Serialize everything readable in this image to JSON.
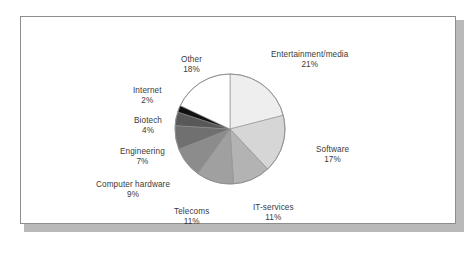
{
  "figure": {
    "background_color": "#ffffff",
    "frame_border_color": "#8d8d8d",
    "shadow_color": "#b9b9b9",
    "label_text_color": "#3a3a3a"
  },
  "chart_data": {
    "type": "pie",
    "title": "",
    "subtitle": "",
    "xlabel": "",
    "ylabel": "",
    "legend_position": "none",
    "grid": false,
    "start_angle_deg": 0,
    "direction": "clockwise",
    "units": "percent",
    "total": 100,
    "categories": [
      "Entertainment/media",
      "Software",
      "IT-services",
      "Telecoms",
      "Computer hardware",
      "Engineering",
      "Biotech",
      "Internet",
      "Other"
    ],
    "values": [
      21,
      17,
      11,
      11,
      9,
      7,
      4,
      2,
      18
    ],
    "slices": [
      {
        "label": "Entertainment/media",
        "value": 21,
        "pct_text": "21%",
        "color": "#eeeeee"
      },
      {
        "label": "Software",
        "value": 17,
        "pct_text": "17%",
        "color": "#d6d6d6"
      },
      {
        "label": "IT-services",
        "value": 11,
        "pct_text": "11%",
        "color": "#b3b3b3"
      },
      {
        "label": "Telecoms",
        "value": 11,
        "pct_text": "11%",
        "color": "#a0a0a0"
      },
      {
        "label": "Computer hardware",
        "value": 9,
        "pct_text": "9%",
        "color": "#8c8c8c"
      },
      {
        "label": "Engineering",
        "value": 7,
        "pct_text": "7%",
        "color": "#707070"
      },
      {
        "label": "Biotech",
        "value": 4,
        "pct_text": "4%",
        "color": "#585858"
      },
      {
        "label": "Internet",
        "value": 2,
        "pct_text": "2%",
        "color": "#111111"
      },
      {
        "label": "Other",
        "value": 18,
        "pct_text": "18%",
        "color": "#ffffff"
      }
    ]
  }
}
